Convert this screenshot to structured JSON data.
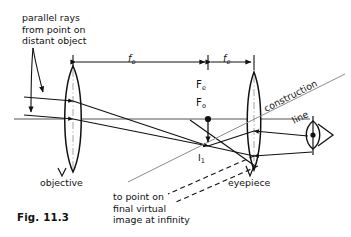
{
  "figure": {
    "number": "Fig. 11.3",
    "type": "optical-ray-diagram"
  },
  "labels": {
    "parallel_rays": "parallel rays\nfrom point on\ndistant object",
    "objective": "objective",
    "eyepiece": "eyepiece",
    "caption_virtual": "to point on\nfinal virtual\nimage at infinity",
    "construction_word": "construction",
    "line_word": "line",
    "intermediate_image": "I",
    "intermediate_image_sub": "1",
    "focal_objective_point": "F",
    "focal_objective_sub": "o",
    "focal_eyepiece_point": "F",
    "focal_eyepiece_sub": "e",
    "f_objective": "f",
    "f_objective_sub": "o",
    "f_eyepiece": "f",
    "f_eyepiece_sub": "e"
  },
  "icons": {
    "eye": "eye-icon",
    "objective_lens": "convex-lens-icon",
    "eyepiece_lens": "convex-lens-icon"
  },
  "colors": {
    "ink": "#111111",
    "axis": "#8c8c8c",
    "construction": "#8c8c8c",
    "background": "#ffffff"
  },
  "geometry": {
    "axis_y": 119,
    "objective_x": 73,
    "eyepiece_x": 254,
    "focal_point_x": 208,
    "f_objective_span": [
      73,
      208
    ],
    "f_eyepiece_span": [
      208,
      254
    ]
  }
}
